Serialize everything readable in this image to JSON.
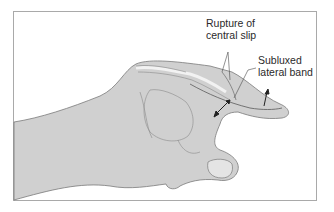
{
  "figure": {
    "labels": {
      "rupture": [
        "Rupture of",
        "central slip"
      ],
      "subluxed": [
        "Subluxed",
        "lateral band"
      ]
    },
    "colors": {
      "skin_fill": "#d3d3d3",
      "outline": "#7a7a7a",
      "frame": "#a9a9a9",
      "text": "#2a2a2a"
    }
  }
}
